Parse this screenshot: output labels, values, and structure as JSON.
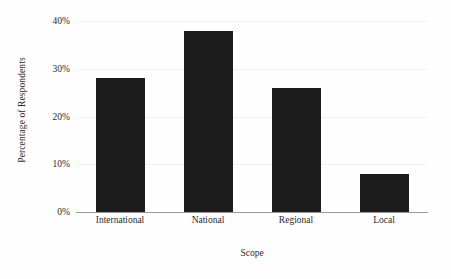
{
  "chart_data": {
    "type": "bar",
    "title": "",
    "subtitle": "",
    "categories": [
      "International",
      "National",
      "Regional",
      "Local"
    ],
    "values": [
      28,
      38,
      26,
      8
    ],
    "series": [
      {
        "name": "Percentage of Respondents",
        "values": [
          28,
          38,
          26,
          8
        ]
      }
    ],
    "xlabel": "Scope",
    "ylabel": "Percentage of Respondents",
    "ylim": [
      0,
      40
    ],
    "yticks": [
      0,
      10,
      20,
      30,
      40
    ],
    "ytick_labels": [
      "0%",
      "10%",
      "20%",
      "30%",
      "40%"
    ],
    "xtick_labels": [
      "International",
      "National",
      "Regional",
      "Local"
    ],
    "grid": true,
    "grid_axis": "y",
    "legend": false,
    "legend_position": "none",
    "annotations": [],
    "bar_color": "#1c1c1c",
    "grid_color": "#f2f2f2",
    "axis_color": "#9a9a9a",
    "background_color": "#fefefe",
    "text_color": "#2b2b2b"
  }
}
